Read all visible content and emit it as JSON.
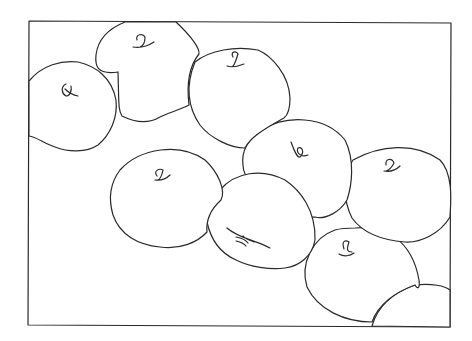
{
  "drawing": {
    "subject": "line drawing of apples",
    "stroke_color": "#2a2a2a",
    "background": "#ffffff",
    "frame": {
      "x": 29,
      "y": 21,
      "w": 189,
      "h": 135
    },
    "apple_count": 10
  }
}
